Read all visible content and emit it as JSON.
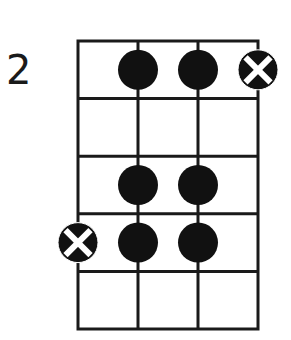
{
  "diagram": {
    "type": "fretboard-chord-diagram",
    "fret_label": "2",
    "strings": 4,
    "frets_shown": 5,
    "colors": {
      "line": "#1a1a1a",
      "dot": "#111111",
      "background": "#ffffff",
      "x_mark": "#ffffff"
    },
    "markers": [
      {
        "string": 2,
        "fret": 1,
        "kind": "dot"
      },
      {
        "string": 3,
        "fret": 1,
        "kind": "dot"
      },
      {
        "string": 4,
        "fret": 1,
        "kind": "x-root"
      },
      {
        "string": 2,
        "fret": 3,
        "kind": "dot"
      },
      {
        "string": 3,
        "fret": 3,
        "kind": "dot"
      },
      {
        "string": 1,
        "fret": 4,
        "kind": "x-root"
      },
      {
        "string": 2,
        "fret": 4,
        "kind": "dot"
      },
      {
        "string": 3,
        "fret": 4,
        "kind": "dot"
      }
    ]
  }
}
